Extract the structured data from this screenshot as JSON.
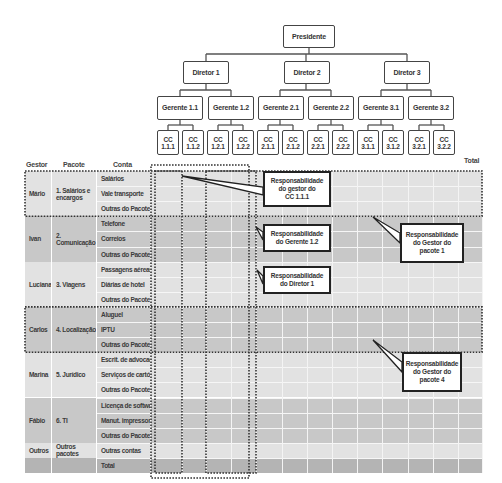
{
  "org_chart": {
    "president": "Presidente",
    "directors": [
      "Diretor 1",
      "Diretor 2",
      "Diretor 3"
    ],
    "managers": [
      "Gerente 1.1",
      "Gerente 1.2",
      "Gerente 2.1",
      "Gerente 2.2",
      "Gerente 3.1",
      "Gerente 3.2"
    ],
    "cost_centers": [
      [
        "CC",
        "1.1.1"
      ],
      [
        "CC",
        "1.1.2"
      ],
      [
        "CC",
        "1.2.1"
      ],
      [
        "CC",
        "1.2.2"
      ],
      [
        "CC",
        "2.1.1"
      ],
      [
        "CC",
        "2.1.2"
      ],
      [
        "CC",
        "2.2.1"
      ],
      [
        "CC",
        "2.2.2"
      ],
      [
        "CC",
        "3.1.1"
      ],
      [
        "CC",
        "3.1.2"
      ],
      [
        "CC",
        "3.2.1"
      ],
      [
        "CC",
        "3.2.2"
      ]
    ]
  },
  "table": {
    "headers": {
      "gestor": "Gestor",
      "pacote": "Pacote",
      "conta": "Conta",
      "total": "Total"
    },
    "groups": [
      {
        "gestor": "Mário",
        "pacote": "1. Salários e encargos",
        "contas": [
          "Salários",
          "Vale transporte",
          "Outras do Pacote"
        ],
        "shade": "light"
      },
      {
        "gestor": "Ivan",
        "pacote": "2. Comunicação",
        "contas": [
          "Telefone",
          "Correios",
          "Outras do Pacote"
        ],
        "shade": "dark"
      },
      {
        "gestor": "Luciana",
        "pacote": "3. Viagens",
        "contas": [
          "Passagens aéreas",
          "Diárias de hotel",
          "Outras do Pacote"
        ],
        "shade": "light"
      },
      {
        "gestor": "Carlos",
        "pacote": "4. Localização",
        "contas": [
          "Aluguel",
          "IPTU",
          "Outras do Pacote"
        ],
        "shade": "dark"
      },
      {
        "gestor": "Marina",
        "pacote": "5. Jurídico",
        "contas": [
          "Escrit. de advocacia",
          "Serviços de cartório",
          "Outras do Pacote"
        ],
        "shade": "light"
      },
      {
        "gestor": "Fábio",
        "pacote": "6. TI",
        "contas": [
          "Licença de softwares",
          "Manut. impressoras",
          "Outras do Pacote"
        ],
        "shade": "dark"
      },
      {
        "gestor": "Outros",
        "pacote": "Outros pacotes",
        "contas": [
          "Outras contas"
        ],
        "shade": "light"
      },
      {
        "gestor": "",
        "pacote": "",
        "contas": [
          "Total"
        ],
        "shade": "total"
      }
    ]
  },
  "callouts": [
    {
      "id": "cc111",
      "lines": [
        "Responsabilidade",
        "do gestor do",
        "CC 1.1.1"
      ]
    },
    {
      "id": "g12",
      "lines": [
        "Responsabilidade",
        "do Gerente 1.2"
      ]
    },
    {
      "id": "d1",
      "lines": [
        "Responsabilidade",
        "do Diretor 1"
      ]
    },
    {
      "id": "p1",
      "lines": [
        "Responsabilidade",
        "do Gestor do",
        "pacote 1"
      ]
    },
    {
      "id": "p4",
      "lines": [
        "Responsabilidade",
        "do Gestor do",
        "pacote 4"
      ]
    }
  ],
  "colors": {
    "light": "#e2e2e2",
    "dark": "#c8c8c8",
    "total": "#b4b4b4",
    "line": "#444444",
    "grid": "#f4f4f4"
  }
}
